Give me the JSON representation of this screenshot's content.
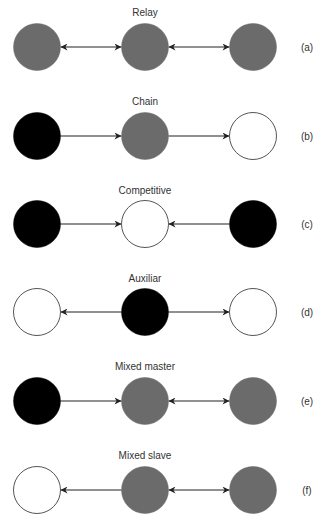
{
  "diagram": {
    "colors": {
      "black": "#000000",
      "gray": "#6b6b6b",
      "white": "#ffffff",
      "outline": "#555555",
      "edge": "#222222"
    },
    "rows": [
      {
        "id": "a",
        "title": "Relay",
        "label": "(a)",
        "nodes": [
          "gray",
          "gray",
          "gray"
        ],
        "edges": [
          {
            "from": 0,
            "to": 1,
            "type": "bidirectional"
          },
          {
            "from": 1,
            "to": 2,
            "type": "bidirectional"
          }
        ]
      },
      {
        "id": "b",
        "title": "Chain",
        "label": "(b)",
        "nodes": [
          "black",
          "gray",
          "white"
        ],
        "edges": [
          {
            "from": 0,
            "to": 1,
            "type": "forward"
          },
          {
            "from": 1,
            "to": 2,
            "type": "forward"
          }
        ]
      },
      {
        "id": "c",
        "title": "Competitive",
        "label": "(c)",
        "nodes": [
          "black",
          "white",
          "black"
        ],
        "edges": [
          {
            "from": 0,
            "to": 1,
            "type": "forward"
          },
          {
            "from": 2,
            "to": 1,
            "type": "forward"
          }
        ]
      },
      {
        "id": "d",
        "title": "Auxiliar",
        "label": "(d)",
        "nodes": [
          "white",
          "black",
          "white"
        ],
        "edges": [
          {
            "from": 1,
            "to": 0,
            "type": "forward"
          },
          {
            "from": 1,
            "to": 2,
            "type": "forward"
          }
        ]
      },
      {
        "id": "e",
        "title": "Mixed master",
        "label": "(e)",
        "nodes": [
          "black",
          "gray",
          "gray"
        ],
        "edges": [
          {
            "from": 0,
            "to": 1,
            "type": "forward"
          },
          {
            "from": 1,
            "to": 2,
            "type": "bidirectional"
          }
        ]
      },
      {
        "id": "f",
        "title": "Mixed slave",
        "label": "(f)",
        "nodes": [
          "white",
          "gray",
          "gray"
        ],
        "edges": [
          {
            "from": 1,
            "to": 0,
            "type": "forward"
          },
          {
            "from": 1,
            "to": 2,
            "type": "bidirectional"
          }
        ]
      }
    ]
  }
}
